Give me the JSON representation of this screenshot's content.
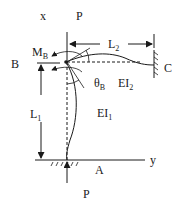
{
  "diagram": {
    "labels": {
      "x_axis": "x",
      "y_axis": "y",
      "load_top": "P",
      "load_bottom": "P",
      "joint_B": "B",
      "support_C": "C",
      "support_A": "A",
      "moment": "M",
      "moment_sub": "B",
      "theta": "θ",
      "theta_sub": "B",
      "L1": "L",
      "L1_sub": "1",
      "L2": "L",
      "L2_sub": "2",
      "EI1": "EI",
      "EI1_sub": "1",
      "EI2": "EI",
      "EI2_sub": "2"
    },
    "colors": {
      "line": "#1a1a1a",
      "background": "#ffffff"
    }
  }
}
